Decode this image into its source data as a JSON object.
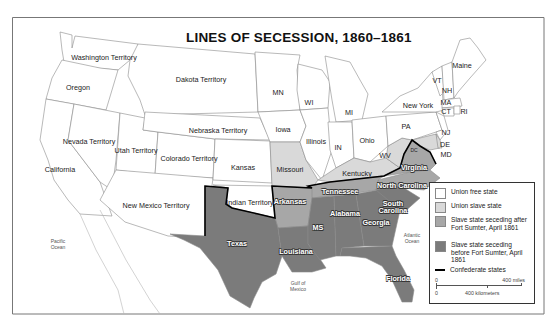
{
  "title": "LINES OF SECESSION, 1860–1861",
  "colors": {
    "union_free": "#ffffff",
    "union_slave": "#d9d9d9",
    "after_sumter": "#a7a7a7",
    "before_sumter": "#7b7b7b",
    "confederate_line": "#000000",
    "border": "#8a8a8a"
  },
  "regions": {
    "washington": "Washington Territory",
    "oregon": "Oregon",
    "california": "California",
    "nevada": "Nevada Territory",
    "utah": "Utah Territory",
    "colorado": "Colorado Territory",
    "new_mexico": "New Mexico Territory",
    "dakota": "Dakota Territory",
    "nebraska": "Nebraska Territory",
    "kansas": "Kansas",
    "indian": "Indian Territory",
    "mn": "MN",
    "iowa": "Iowa",
    "missouri": "Missouri",
    "wi": "WI",
    "illinois": "Illinois",
    "mi": "MI",
    "in": "IN",
    "ohio": "Ohio",
    "kentucky": "Kentucky",
    "wv": "WV",
    "pa": "PA",
    "new_york": "New York",
    "vt": "VT",
    "nh": "NH",
    "maine": "Maine",
    "ma": "MA",
    "ct": "CT",
    "ri": "RI",
    "nj": "NJ",
    "de": "DE",
    "md": "MD",
    "dc": "DC",
    "virginia": "Virginia",
    "north_carolina": "North Carolina",
    "tennessee": "Tennessee",
    "arkansas": "Arkansas",
    "texas": "Texas",
    "louisiana": "Louisiana",
    "ms": "MS",
    "alabama": "Alabama",
    "georgia": "Georgia",
    "south_carolina": "South Carolina",
    "florida": "Florida"
  },
  "water": {
    "pacific": "Pacific Ocean",
    "atlantic": "Atlantic Ocean",
    "gulf": "Gulf of Mexico"
  },
  "legend": {
    "items": [
      {
        "label": "Union free state"
      },
      {
        "label": "Union slave state"
      },
      {
        "label": "Slave state seceding after Fort Sumter, April 1861"
      },
      {
        "label": "Slave state seceding before Fort Sumter, April 1861"
      },
      {
        "label": "Confederate states"
      }
    ],
    "scale": {
      "zero": "0",
      "miles": "400 miles",
      "km": "400 kilometers"
    }
  }
}
